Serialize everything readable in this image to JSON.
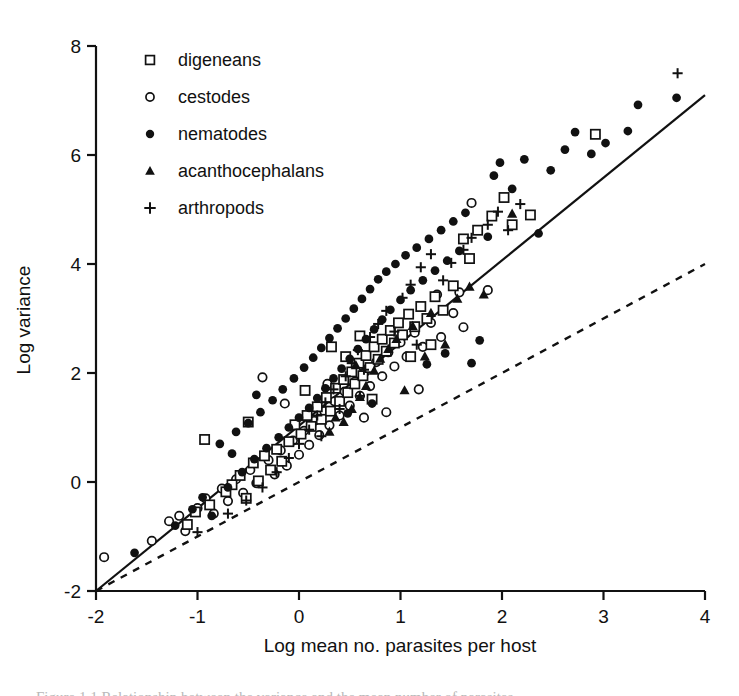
{
  "figure": {
    "caption_partial": "Figure 1.1 Relationship between the variance and the mean number of parasites"
  },
  "chart_data": {
    "type": "scatter",
    "title": "",
    "xlabel": "Log mean no. parasites per host",
    "ylabel": "Log variance",
    "xlim": [
      -2,
      4
    ],
    "ylim": [
      -2,
      8
    ],
    "xticks": [
      -2,
      -1,
      0,
      1,
      2,
      3,
      4
    ],
    "yticks": [
      -2,
      0,
      2,
      4,
      6,
      8
    ],
    "xtick_labels": [
      "-2",
      "-1",
      "0",
      "1",
      "2",
      "3",
      "4"
    ],
    "ytick_labels": [
      "-2",
      "0",
      "2",
      "4",
      "6",
      "8"
    ],
    "grid": false,
    "legend_position": "upper-left",
    "marker_color": "#111111",
    "legend": [
      {
        "label": "digeneans",
        "marker": "open-square",
        "key": "digeneans"
      },
      {
        "label": "cestodes",
        "marker": "open-circle",
        "key": "cestodes"
      },
      {
        "label": "nematodes",
        "marker": "filled-circle",
        "key": "nematodes"
      },
      {
        "label": "acanthocephalans",
        "marker": "filled-triangle",
        "key": "acanthocephalans"
      },
      {
        "label": "arthropods",
        "marker": "plus",
        "key": "arthropods"
      }
    ],
    "lines": [
      {
        "name": "regression-line",
        "style": "solid",
        "x": [
          -2,
          4
        ],
        "y": [
          -2,
          7.1
        ]
      },
      {
        "name": "poisson-reference-line",
        "style": "dashed",
        "x": [
          -2,
          4
        ],
        "y": [
          -2,
          4.0
        ]
      }
    ],
    "series": [
      {
        "name": "digeneans",
        "marker": "open-square",
        "points": [
          [
            -1.1,
            -0.78
          ],
          [
            -1.02,
            -0.55
          ],
          [
            -0.93,
            0.78
          ],
          [
            -0.88,
            -0.42
          ],
          [
            -0.72,
            -0.18
          ],
          [
            -0.66,
            -0.05
          ],
          [
            -0.58,
            0.12
          ],
          [
            -0.52,
            -0.3
          ],
          [
            -0.45,
            0.35
          ],
          [
            -0.4,
            0.02
          ],
          [
            -0.34,
            0.48
          ],
          [
            -0.28,
            0.22
          ],
          [
            -0.22,
            0.6
          ],
          [
            -0.17,
            0.38
          ],
          [
            -0.1,
            0.74
          ],
          [
            -0.04,
            1.05
          ],
          [
            0.02,
            0.88
          ],
          [
            0.08,
            1.22
          ],
          [
            0.12,
            1.02
          ],
          [
            0.18,
            1.38
          ],
          [
            0.22,
            1.15
          ],
          [
            0.27,
            1.55
          ],
          [
            0.31,
            1.3
          ],
          [
            0.36,
            1.72
          ],
          [
            0.4,
            1.48
          ],
          [
            0.44,
            1.88
          ],
          [
            0.48,
            1.64
          ],
          [
            0.52,
            2.02
          ],
          [
            0.55,
            1.8
          ],
          [
            0.59,
            2.18
          ],
          [
            0.63,
            1.95
          ],
          [
            0.66,
            2.32
          ],
          [
            0.7,
            2.1
          ],
          [
            0.74,
            2.48
          ],
          [
            0.78,
            2.25
          ],
          [
            0.82,
            2.62
          ],
          [
            0.86,
            2.4
          ],
          [
            0.9,
            2.78
          ],
          [
            0.94,
            2.55
          ],
          [
            0.98,
            2.92
          ],
          [
            1.02,
            2.7
          ],
          [
            1.08,
            3.08
          ],
          [
            1.14,
            2.85
          ],
          [
            1.2,
            3.22
          ],
          [
            1.26,
            3.0
          ],
          [
            1.34,
            3.4
          ],
          [
            1.42,
            3.15
          ],
          [
            1.52,
            3.6
          ],
          [
            1.62,
            4.46
          ],
          [
            1.68,
            4.1
          ],
          [
            1.76,
            4.62
          ],
          [
            1.9,
            4.88
          ],
          [
            2.02,
            5.22
          ],
          [
            2.1,
            4.72
          ],
          [
            2.28,
            4.9
          ],
          [
            2.92,
            6.38
          ],
          [
            0.32,
            2.48
          ],
          [
            0.46,
            2.3
          ],
          [
            0.6,
            2.68
          ],
          [
            0.72,
            1.52
          ],
          [
            -0.5,
            1.1
          ],
          [
            0.06,
            1.68
          ],
          [
            1.1,
            2.3
          ],
          [
            1.3,
            2.52
          ]
        ]
      },
      {
        "name": "cestodes",
        "marker": "open-circle",
        "points": [
          [
            -1.92,
            -1.38
          ],
          [
            -1.45,
            -1.08
          ],
          [
            -1.28,
            -0.72
          ],
          [
            -1.18,
            -0.62
          ],
          [
            -1.12,
            -0.9
          ],
          [
            -1.0,
            -0.48
          ],
          [
            -0.92,
            -0.3
          ],
          [
            -0.84,
            -0.58
          ],
          [
            -0.76,
            -0.12
          ],
          [
            -0.7,
            -0.35
          ],
          [
            -0.62,
            0.05
          ],
          [
            -0.55,
            -0.2
          ],
          [
            -0.48,
            0.22
          ],
          [
            -0.42,
            -0.02
          ],
          [
            -0.36,
            1.92
          ],
          [
            -0.3,
            0.4
          ],
          [
            -0.24,
            0.14
          ],
          [
            -0.18,
            0.58
          ],
          [
            -0.12,
            0.3
          ],
          [
            -0.06,
            0.76
          ],
          [
            0.0,
            0.5
          ],
          [
            0.05,
            0.94
          ],
          [
            0.1,
            0.68
          ],
          [
            0.15,
            1.12
          ],
          [
            0.2,
            0.86
          ],
          [
            0.25,
            1.3
          ],
          [
            0.3,
            1.04
          ],
          [
            0.35,
            1.48
          ],
          [
            0.4,
            1.22
          ],
          [
            0.45,
            1.66
          ],
          [
            0.5,
            1.4
          ],
          [
            0.55,
            1.84
          ],
          [
            0.6,
            1.58
          ],
          [
            0.65,
            2.02
          ],
          [
            0.7,
            1.76
          ],
          [
            0.76,
            2.2
          ],
          [
            0.82,
            1.94
          ],
          [
            0.88,
            2.38
          ],
          [
            0.94,
            2.12
          ],
          [
            1.0,
            2.56
          ],
          [
            1.06,
            2.3
          ],
          [
            1.14,
            2.74
          ],
          [
            1.22,
            2.48
          ],
          [
            1.3,
            2.92
          ],
          [
            1.4,
            2.66
          ],
          [
            1.52,
            3.1
          ],
          [
            1.62,
            2.84
          ],
          [
            1.58,
            3.48
          ],
          [
            1.7,
            5.12
          ],
          [
            1.86,
            3.52
          ],
          [
            -0.14,
            1.44
          ],
          [
            0.28,
            1.8
          ],
          [
            0.64,
            1.18
          ],
          [
            1.18,
            1.7
          ],
          [
            0.86,
            1.28
          ],
          [
            1.36,
            3.44
          ]
        ]
      },
      {
        "name": "nematodes",
        "marker": "filled-circle",
        "points": [
          [
            -1.62,
            -1.3
          ],
          [
            -1.22,
            -0.8
          ],
          [
            -1.05,
            -0.5
          ],
          [
            -0.95,
            -0.28
          ],
          [
            -0.86,
            -0.62
          ],
          [
            -0.78,
            0.7
          ],
          [
            -0.7,
            -0.1
          ],
          [
            -0.62,
            0.92
          ],
          [
            -0.56,
            0.18
          ],
          [
            -0.5,
            1.08
          ],
          [
            -0.44,
            0.42
          ],
          [
            -0.38,
            1.28
          ],
          [
            -0.32,
            0.62
          ],
          [
            -0.26,
            1.5
          ],
          [
            -0.2,
            0.82
          ],
          [
            -0.16,
            1.7
          ],
          [
            -0.1,
            1.0
          ],
          [
            -0.05,
            1.9
          ],
          [
            0.0,
            1.18
          ],
          [
            0.05,
            2.1
          ],
          [
            0.1,
            1.36
          ],
          [
            0.14,
            2.28
          ],
          [
            0.18,
            1.54
          ],
          [
            0.22,
            2.46
          ],
          [
            0.26,
            1.72
          ],
          [
            0.3,
            2.64
          ],
          [
            0.34,
            1.9
          ],
          [
            0.38,
            2.82
          ],
          [
            0.42,
            2.08
          ],
          [
            0.46,
            3.0
          ],
          [
            0.5,
            2.26
          ],
          [
            0.54,
            3.18
          ],
          [
            0.58,
            2.44
          ],
          [
            0.62,
            3.36
          ],
          [
            0.66,
            2.62
          ],
          [
            0.7,
            3.54
          ],
          [
            0.74,
            2.8
          ],
          [
            0.78,
            3.72
          ],
          [
            0.82,
            2.98
          ],
          [
            0.86,
            3.86
          ],
          [
            0.9,
            3.16
          ],
          [
            0.95,
            4.0
          ],
          [
            1.0,
            3.34
          ],
          [
            1.05,
            4.16
          ],
          [
            1.1,
            3.52
          ],
          [
            1.16,
            4.3
          ],
          [
            1.22,
            3.7
          ],
          [
            1.28,
            4.46
          ],
          [
            1.34,
            3.88
          ],
          [
            1.4,
            4.62
          ],
          [
            1.46,
            4.06
          ],
          [
            1.52,
            4.78
          ],
          [
            1.58,
            4.24
          ],
          [
            1.64,
            4.94
          ],
          [
            1.7,
            2.18
          ],
          [
            1.78,
            2.6
          ],
          [
            1.86,
            4.5
          ],
          [
            1.92,
            5.62
          ],
          [
            1.98,
            5.86
          ],
          [
            2.1,
            5.38
          ],
          [
            2.22,
            5.92
          ],
          [
            2.36,
            4.56
          ],
          [
            2.48,
            5.72
          ],
          [
            2.62,
            6.1
          ],
          [
            2.72,
            6.42
          ],
          [
            2.88,
            6.02
          ],
          [
            3.02,
            6.22
          ],
          [
            3.24,
            6.44
          ],
          [
            3.34,
            6.92
          ],
          [
            3.72,
            7.05
          ],
          [
            0.48,
            1.26
          ],
          [
            0.72,
            1.44
          ],
          [
            1.26,
            2.16
          ],
          [
            1.44,
            2.36
          ],
          [
            -0.66,
            0.52
          ],
          [
            -0.42,
            1.6
          ]
        ]
      },
      {
        "name": "acanthocephalans",
        "marker": "filled-triangle",
        "points": [
          [
            0.3,
            0.92
          ],
          [
            0.44,
            1.1
          ],
          [
            0.52,
            1.34
          ],
          [
            0.6,
            1.56
          ],
          [
            0.66,
            1.76
          ],
          [
            0.74,
            2.04
          ],
          [
            0.8,
            2.26
          ],
          [
            0.88,
            2.44
          ],
          [
            0.96,
            2.62
          ],
          [
            1.04,
            1.68
          ],
          [
            1.12,
            2.86
          ],
          [
            1.24,
            2.3
          ],
          [
            1.3,
            3.1
          ],
          [
            1.44,
            2.52
          ],
          [
            1.56,
            3.36
          ],
          [
            1.68,
            3.58
          ],
          [
            1.82,
            3.44
          ],
          [
            2.1,
            4.92
          ],
          [
            0.36,
            1.18
          ],
          [
            0.56,
            2.14
          ]
        ]
      },
      {
        "name": "arthropods",
        "marker": "plus",
        "points": [
          [
            -1.0,
            -0.92
          ],
          [
            -0.7,
            -0.58
          ],
          [
            -0.52,
            -0.34
          ],
          [
            -0.36,
            -0.1
          ],
          [
            -0.22,
            0.18
          ],
          [
            -0.1,
            0.44
          ],
          [
            0.0,
            0.7
          ],
          [
            0.1,
            0.96
          ],
          [
            0.18,
            1.22
          ],
          [
            0.26,
            1.46
          ],
          [
            0.34,
            1.7
          ],
          [
            0.4,
            1.34
          ],
          [
            0.46,
            1.94
          ],
          [
            0.52,
            2.18
          ],
          [
            0.58,
            2.42
          ],
          [
            0.64,
            2.06
          ],
          [
            0.7,
            2.66
          ],
          [
            0.78,
            2.9
          ],
          [
            0.86,
            3.14
          ],
          [
            0.94,
            2.76
          ],
          [
            1.02,
            3.38
          ],
          [
            1.1,
            3.62
          ],
          [
            1.2,
            3.94
          ],
          [
            1.3,
            4.18
          ],
          [
            1.42,
            3.7
          ],
          [
            1.5,
            4.02
          ],
          [
            1.62,
            4.26
          ],
          [
            1.7,
            4.48
          ],
          [
            1.86,
            4.72
          ],
          [
            1.96,
            4.96
          ],
          [
            2.06,
            4.62
          ],
          [
            2.18,
            5.1
          ],
          [
            3.73,
            7.5
          ],
          [
            0.22,
            0.84
          ],
          [
            0.6,
            1.58
          ],
          [
            1.16,
            2.52
          ]
        ]
      }
    ]
  }
}
